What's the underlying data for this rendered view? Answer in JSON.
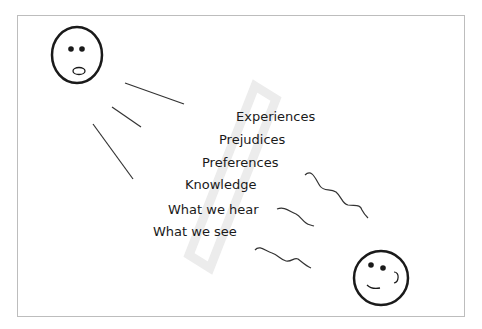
{
  "diagram": {
    "layers": [
      {
        "label": "Experiences",
        "x": 236,
        "y": 110
      },
      {
        "label": "Prejudices",
        "x": 219,
        "y": 133
      },
      {
        "label": "Preferences",
        "x": 202,
        "y": 156
      },
      {
        "label": "Knowledge",
        "x": 185,
        "y": 178
      },
      {
        "label": "What we hear",
        "x": 168,
        "y": 203
      },
      {
        "label": "What we see",
        "x": 153,
        "y": 225
      }
    ],
    "speaker_face": {
      "expression": "surprised-icon"
    },
    "listener_face": {
      "expression": "smiling-icon"
    },
    "colors": {
      "stroke": "#1a1a1a",
      "frame": "#bdbdbd",
      "filter": "#eeeeee"
    }
  }
}
